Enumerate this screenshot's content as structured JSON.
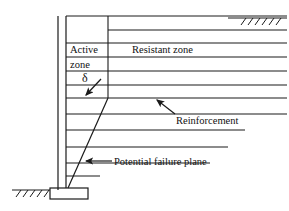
{
  "figure": {
    "type": "engineering-cross-section",
    "background_color": "#ffffff",
    "line_color": "#1a1a1a"
  },
  "labels": {
    "active_zone_line1": "Active",
    "active_zone_line2": "zone",
    "resistant_zone": "Resistant zone",
    "reinforcement": "Reinforcement",
    "failure_plane": "Potential failure plane",
    "delta_symbol": "δ"
  },
  "geometry": {
    "wall": {
      "outer_x": 58,
      "inner_x": 66,
      "top_y": 16,
      "bottom_y": 188
    },
    "footing": {
      "x": 50,
      "y": 188,
      "width": 38,
      "height": 11
    },
    "backfill_top_y": 16,
    "active_zone_boundary_x": 108,
    "ground_surface_right": {
      "y": 18,
      "x_start": 228,
      "x_end": 287
    },
    "ground_surface_left": {
      "y": 190,
      "x_start": 12,
      "x_end": 52
    },
    "failure_plane": {
      "x_bottom": 68,
      "y_bottom": 188,
      "x_top": 108,
      "y_top": 98
    },
    "reinforcement_lines": [
      {
        "y": 30,
        "x_start": 108,
        "x_end": 287
      },
      {
        "y": 43,
        "x_start": 66,
        "x_end": 287
      },
      {
        "y": 57,
        "x_start": 66,
        "x_end": 287
      },
      {
        "y": 71,
        "x_start": 66,
        "x_end": 287
      },
      {
        "y": 85,
        "x_start": 66,
        "x_end": 287
      },
      {
        "y": 98,
        "x_start": 66,
        "x_end": 287
      },
      {
        "y": 114,
        "x_start": 66,
        "x_end": 287
      },
      {
        "y": 130,
        "x_start": 66,
        "x_end": 245
      },
      {
        "y": 147,
        "x_start": 66,
        "x_end": 228
      },
      {
        "y": 163,
        "x_start": 66,
        "x_end": 210
      },
      {
        "y": 176,
        "x_start": 66,
        "x_end": 100
      }
    ],
    "zone_divider_segments": [
      {
        "x": 108,
        "y_top": 16,
        "y_bottom": 98
      }
    ]
  },
  "annotations": {
    "delta_arrow": {
      "x1": 101,
      "y1": 79,
      "x2": 85,
      "y2": 96
    },
    "reinforcement_arrow": {
      "x1": 175,
      "y1": 113,
      "x2": 155,
      "y2": 101
    },
    "failure_plane_arrow": {
      "x1": 110,
      "y1": 161,
      "x2": 85,
      "y2": 161
    }
  }
}
